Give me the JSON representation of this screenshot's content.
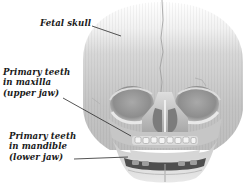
{
  "figure": {
    "labels": [
      {
        "id": "fetal-skull",
        "lines": [
          "Fetal skull"
        ]
      },
      {
        "id": "maxilla-teeth",
        "lines": [
          "Primary teeth",
          "in maxilla",
          "(upper jaw)"
        ]
      },
      {
        "id": "mandible-teeth",
        "lines": [
          "Primary teeth",
          "in mandible",
          "(lower jaw)"
        ]
      }
    ]
  },
  "colors": {
    "background": "#ffffff",
    "label_text": "#1a1a1a",
    "leader_line": "#2a2a2a",
    "bone_light": "#e6e6e6",
    "bone_mid": "#b5b5b5",
    "bone_dark": "#5e5e5e",
    "cavity": "#8a8a8a"
  }
}
